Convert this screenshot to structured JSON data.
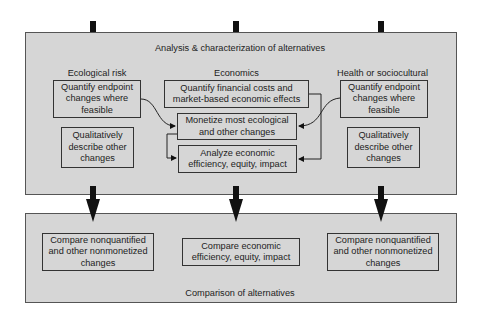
{
  "analysis_panel": {
    "title": "Analysis & characterization of alternatives",
    "columns": [
      {
        "header": "Ecological risk",
        "boxes": [
          "Quantify endpoint changes where feasible",
          "Qualitatively describe other changes"
        ]
      },
      {
        "header": "Economics",
        "boxes": [
          "Quantify financial costs and market-based economic effects",
          "Monetize most ecological and other changes",
          "Analyze economic efficiency, equity, impact"
        ]
      },
      {
        "header": "Health or sociocultural",
        "boxes": [
          "Quantify endpoint changes where feasible",
          "Qualitatively describe other changes"
        ]
      }
    ]
  },
  "comparison_panel": {
    "title": "Comparison of alternatives",
    "boxes": [
      "Compare nonquantified and other nonmonetized changes",
      "Compare economic efficiency, equity, impact",
      "Compare nonquantified and other nonmonetized changes"
    ]
  },
  "colors": {
    "panel_fill": "#d6d6d6",
    "border": "#333333",
    "arrow": "#111111",
    "background": "#ffffff"
  }
}
